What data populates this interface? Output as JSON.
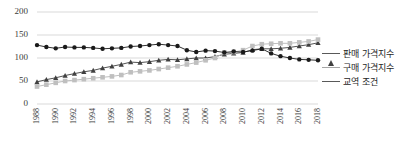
{
  "chart_data": {
    "type": "line",
    "title": "",
    "xlabel": "",
    "ylabel": "",
    "ylim": [
      0,
      200
    ],
    "ytick_labels": [
      "0",
      "50",
      "100",
      "150",
      "200"
    ],
    "yticks": [
      0,
      50,
      100,
      150,
      200
    ],
    "grid": true,
    "legend_position": "right",
    "x": [
      1988,
      1989,
      1990,
      1991,
      1992,
      1993,
      1994,
      1995,
      1996,
      1997,
      1998,
      1999,
      2000,
      2001,
      2002,
      2003,
      2004,
      2005,
      2006,
      2007,
      2008,
      2009,
      2010,
      2011,
      2012,
      2013,
      2014,
      2015,
      2016,
      2017,
      2018
    ],
    "xtick_labels": [
      "1988",
      "1990",
      "1992",
      "1994",
      "1996",
      "1998",
      "2000",
      "2002",
      "2004",
      "2006",
      "2008",
      "2010",
      "2012",
      "2014",
      "2016",
      "2018"
    ],
    "xticks": [
      1988,
      1990,
      1992,
      1994,
      1996,
      1998,
      2000,
      2002,
      2004,
      2006,
      2008,
      2010,
      2012,
      2014,
      2016,
      2018
    ],
    "series": [
      {
        "name": "판매 가격지수",
        "marker": "triangle",
        "color": "#404040",
        "values": [
          48,
          53,
          57,
          62,
          66,
          70,
          73,
          78,
          82,
          86,
          91,
          90,
          92,
          95,
          97,
          96,
          98,
          100,
          100,
          103,
          108,
          110,
          112,
          118,
          120,
          120,
          121,
          123,
          126,
          129,
          133
        ]
      },
      {
        "name": "구매 가격지수",
        "marker": "square",
        "color": "#bfbfbf",
        "values": [
          38,
          42,
          46,
          50,
          52,
          54,
          56,
          58,
          60,
          63,
          69,
          71,
          73,
          76,
          79,
          82,
          86,
          90,
          95,
          100,
          112,
          113,
          117,
          126,
          130,
          131,
          132,
          132,
          134,
          136,
          140
        ]
      },
      {
        "name": "교역 조건",
        "marker": "circle",
        "color": "#1a1a1a",
        "values": [
          128,
          124,
          121,
          124,
          123,
          123,
          122,
          120,
          121,
          122,
          125,
          126,
          128,
          130,
          128,
          126,
          117,
          113,
          116,
          115,
          112,
          114,
          113,
          116,
          120,
          110,
          104,
          100,
          97,
          96,
          95
        ]
      }
    ]
  },
  "legend": {
    "items": [
      {
        "label": "판매 가격지수",
        "marker": "triangle"
      },
      {
        "label": "구매 가격지수",
        "marker": "square"
      },
      {
        "label": "교역 조건",
        "marker": "circle"
      }
    ]
  }
}
